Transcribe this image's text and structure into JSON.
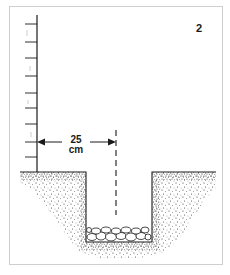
{
  "figure": {
    "number": "2",
    "dimension": {
      "value": "25",
      "unit": "cm"
    },
    "elements": [
      "brick-wall",
      "ground-surface",
      "trench",
      "gravel-rubble-base",
      "centerline",
      "dimension-arrow"
    ]
  },
  "colors": {
    "ink": "#1a1a1a",
    "frame_border": "#cfcfcf",
    "background": "#ffffff"
  }
}
